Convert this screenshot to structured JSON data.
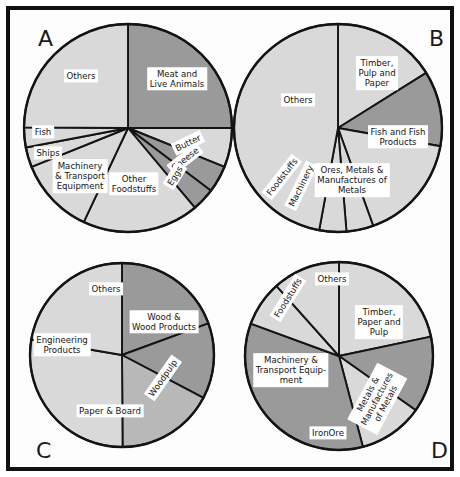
{
  "figure": {
    "title": "",
    "background": "#ffffff",
    "frame_color": "#111111",
    "panel_letters": [
      "A",
      "B",
      "C",
      "D"
    ]
  },
  "palette": {
    "light": "#d9d9d9",
    "mid": "#b8b8b8",
    "dark": "#9a9a9a",
    "outline": "#141414",
    "label_bg": "#ffffff",
    "label_text": "#141414"
  },
  "chart_data": [
    {
      "type": "pie",
      "panel": "A",
      "title": "",
      "center": [
        128,
        128
      ],
      "radius": 104,
      "start_angle_deg": 0,
      "direction": "clockwise",
      "categories": [
        "Meat and\nLive Animals",
        "Butter",
        "Cheese",
        "Eggs",
        "Other\nFoodstuffs",
        "Machinery\n& Transport\nEquipment",
        "Ships",
        "Fish",
        "Others"
      ],
      "values": [
        25.0,
        6.1,
        4.2,
        3.6,
        18.1,
        11.9,
        3.1,
        3.1,
        24.9
      ],
      "shades": [
        "dark",
        "light",
        "dark",
        "dark",
        "light",
        "light",
        "light",
        "light",
        "light"
      ],
      "labels": [
        {
          "text": "Meat and\nLive Animals",
          "x": 177,
          "y": 79,
          "rot": 0
        },
        {
          "text": "Butter",
          "x": 188,
          "y": 143,
          "rot": -26
        },
        {
          "text": "Cheese",
          "x": 185,
          "y": 159,
          "rot": -38
        },
        {
          "text": "Eggs",
          "x": 175,
          "y": 176,
          "rot": -58
        },
        {
          "text": "Other\nFoodstuffs",
          "x": 134,
          "y": 184,
          "rot": 0
        },
        {
          "text": "Machinery\n& Transport\nEquipment",
          "x": 80,
          "y": 176,
          "rot": 0
        },
        {
          "text": "Ships",
          "x": 48,
          "y": 153,
          "rot": 0
        },
        {
          "text": "Fish",
          "x": 43,
          "y": 132,
          "rot": 0
        },
        {
          "text": "Others",
          "x": 81,
          "y": 76,
          "rot": 0
        }
      ]
    },
    {
      "type": "pie",
      "panel": "B",
      "title": "",
      "center": [
        338,
        128
      ],
      "radius": 104,
      "start_angle_deg": 0,
      "direction": "clockwise",
      "categories": [
        "Timber,\nPulp and\nPaper",
        "Fish and Fish\nProducts",
        "Ores, Metals &\nManufactures of\nMetals",
        "Machinery",
        "Foodstuffs",
        "Others"
      ],
      "values": [
        16.1,
        11.7,
        16.7,
        4.2,
        4.2,
        47.1
      ],
      "shades": [
        "light",
        "dark",
        "light",
        "light",
        "light",
        "light"
      ],
      "labels": [
        {
          "text": "Timber,\nPulp and\nPaper",
          "x": 377,
          "y": 73,
          "rot": 0
        },
        {
          "text": "Fish and Fish\nProducts",
          "x": 398,
          "y": 137,
          "rot": 0
        },
        {
          "text": "Ores, Metals &\nManufactures of\nMetals",
          "x": 352,
          "y": 180,
          "rot": 0
        },
        {
          "text": "Machinery",
          "x": 301,
          "y": 186,
          "rot": -64
        },
        {
          "text": "Foodstuffs",
          "x": 282,
          "y": 177,
          "rot": -52
        },
        {
          "text": "Others",
          "x": 298,
          "y": 100,
          "rot": 0
        }
      ]
    },
    {
      "type": "pie",
      "panel": "C",
      "title": "",
      "center": [
        122,
        355
      ],
      "radius": 92,
      "start_angle_deg": 0,
      "direction": "clockwise",
      "categories": [
        "Wood &\nWood Products",
        "Woodpulp",
        "Paper & Board",
        "Engineering\nProducts",
        "Others"
      ],
      "values": [
        19.4,
        13.3,
        17.2,
        27.8,
        22.3
      ],
      "shades": [
        "dark",
        "dark",
        "mid",
        "light",
        "light"
      ],
      "labels": [
        {
          "text": "Wood &\nWood Products",
          "x": 164,
          "y": 322,
          "rot": 0
        },
        {
          "text": "Woodpulp",
          "x": 163,
          "y": 378,
          "rot": -55
        },
        {
          "text": "Paper & Board",
          "x": 110,
          "y": 411,
          "rot": 0
        },
        {
          "text": "Engineering\nProducts",
          "x": 62,
          "y": 345,
          "rot": 0
        },
        {
          "text": "Others",
          "x": 106,
          "y": 289,
          "rot": 0
        }
      ]
    },
    {
      "type": "pie",
      "panel": "D",
      "title": "",
      "center": [
        339,
        356
      ],
      "radius": 94,
      "start_angle_deg": 0,
      "direction": "clockwise",
      "categories": [
        "Timber,\nPaper and\nPulp",
        "Metals &\nManufactures\nof Metals",
        "Iron Ore",
        "Machinery &\nTransport Equip-\nment",
        "Foodstuffs",
        "Others"
      ],
      "values": [
        21.7,
        13.1,
        11.1,
        34.7,
        7.8,
        11.6
      ],
      "shades": [
        "light",
        "dark",
        "light",
        "dark",
        "light",
        "light"
      ],
      "labels": [
        {
          "text": "Timber,\nPaper and\nPulp",
          "x": 379,
          "y": 322,
          "rot": 0
        },
        {
          "text": "Metals &\nManufactures\nof Metals",
          "x": 377,
          "y": 399,
          "rot": -62
        },
        {
          "text": "IronOre",
          "x": 328,
          "y": 433,
          "rot": 0
        },
        {
          "text": "Machinery &\nTransport Equip-\nment",
          "x": 291,
          "y": 370,
          "rot": 0
        },
        {
          "text": "Foodstuffs",
          "x": 288,
          "y": 298,
          "rot": -58
        },
        {
          "text": "Others",
          "x": 332,
          "y": 279,
          "rot": 0
        }
      ]
    }
  ]
}
